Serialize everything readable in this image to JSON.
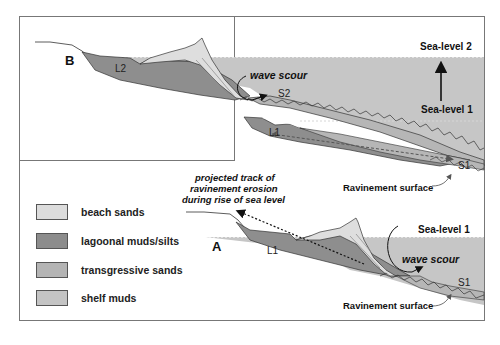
{
  "panels": {
    "top": {
      "label": "B"
    },
    "bottom": {
      "label": "A"
    }
  },
  "labels": {
    "sea_level_2": "Sea-level 2",
    "sea_level_1_top": "Sea-level 1",
    "sea_level_1_bottom": "Sea-level 1",
    "wave_scour_top": "wave scour",
    "wave_scour_bottom": "wave scour",
    "s2": "S2",
    "s1_top": "S1",
    "s1_bottom": "S1",
    "l2": "L2",
    "l1_top": "L1",
    "l1_bottom": "L1",
    "ravinement_top": "Ravinement surface",
    "ravinement_bottom": "Ravinement surface",
    "projected_track": [
      "projected track of",
      "ravinement erosion",
      "during rise of sea level"
    ]
  },
  "legend": {
    "items": [
      {
        "label": "beach sands",
        "color": "#dcdcdc"
      },
      {
        "label": "lagoonal muds/silts",
        "color": "#8c8c8c"
      },
      {
        "label": "transgressive sands",
        "color": "#b4b4b4"
      },
      {
        "label": "shelf muds",
        "color": "#c4c4c4"
      }
    ]
  },
  "colors": {
    "sea": "#c6c6c6",
    "lagoon": "#8e8e8e",
    "beach": "#dedede",
    "transgressive": "#b6b6b6",
    "border": "#777777"
  }
}
